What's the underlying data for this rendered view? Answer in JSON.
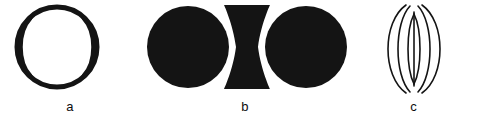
{
  "figure": {
    "background_color": "#ffffff",
    "ink_color": "#141414",
    "width": 477,
    "height": 120,
    "panels": [
      {
        "label": "a",
        "name": "tennis-ball-circle",
        "description": "Circle outline with two inward-bowing arcs",
        "stroke_width": 5,
        "fill": "none",
        "outline_circle": {
          "cx": 57,
          "cy": 47,
          "r": 40
        },
        "inner_arcs": [
          {
            "side": "left",
            "bow": 14
          },
          {
            "side": "right",
            "bow": 14
          }
        ]
      },
      {
        "label": "b",
        "name": "rubin-vase-two-disks",
        "description": "Two filled disks flanking an hourglass vase silhouette",
        "fill": "#141414",
        "disks": [
          {
            "side": "left",
            "cx": 48,
            "cy": 47,
            "r": 40
          },
          {
            "side": "right",
            "cx": 166,
            "cy": 47,
            "r": 40
          }
        ],
        "vase": {
          "top_y": 5,
          "bottom_y": 89,
          "top_half_width": 23,
          "waist_half_width": 11,
          "center_x": 107
        }
      },
      {
        "label": "c",
        "name": "nested-lens-ellipses",
        "description": "Three nested lens shapes sharing top and bottom vertices",
        "stroke_width": 1.6,
        "fill": "none",
        "apex_top_y": 14,
        "apex_bottom_y": 84,
        "center_x": 64,
        "lens_half_widths": [
          30,
          18,
          7
        ],
        "overshoot": 9
      }
    ]
  }
}
